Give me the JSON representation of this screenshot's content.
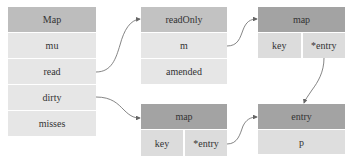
{
  "boxes": {
    "map_struct": {
      "title": "Map",
      "fields": [
        "mu",
        "read",
        "dirty",
        "misses"
      ]
    },
    "read_only": {
      "title": "readOnly",
      "fields": [
        "m",
        "amended"
      ]
    },
    "read_map": {
      "title": "map",
      "key": "key",
      "value": "*entry"
    },
    "dirty_map": {
      "title": "map",
      "key": "key",
      "value": "*entry"
    },
    "entry": {
      "title": "entry",
      "fields": [
        "p"
      ]
    }
  },
  "colors": {
    "map_header": "#bdbdbd",
    "row": "#e6e6e6",
    "dark_header": "#a3a3a3",
    "split_cell": "#dcdcdc",
    "arrow": "#666666"
  },
  "arrows": [
    {
      "from": "Map.read",
      "to": "readOnly"
    },
    {
      "from": "Map.dirty",
      "to": "dirty map"
    },
    {
      "from": "readOnly.m",
      "to": "read map"
    },
    {
      "from": "read map.*entry",
      "to": "entry"
    },
    {
      "from": "dirty map.*entry",
      "to": "entry"
    }
  ]
}
